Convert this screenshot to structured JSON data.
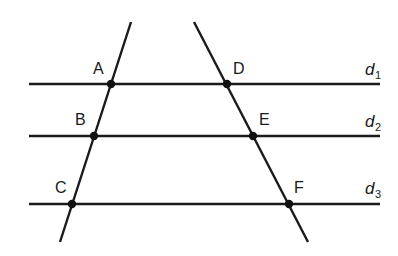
{
  "diagram": {
    "colors": {
      "stroke": "#1a1a1a",
      "point": "#111111",
      "background": "#ffffff"
    },
    "parallels": [
      {
        "id": "d1",
        "letter": "d",
        "subscript": "1",
        "y": 84,
        "x1": 29,
        "x2": 380
      },
      {
        "id": "d2",
        "letter": "d",
        "subscript": "2",
        "y": 136,
        "x1": 29,
        "x2": 380
      },
      {
        "id": "d3",
        "letter": "d",
        "subscript": "3",
        "y": 204,
        "x1": 29,
        "x2": 380
      }
    ],
    "transversals": [
      {
        "id": "left",
        "x1": 131,
        "y1": 22,
        "x2": 60,
        "y2": 242
      },
      {
        "id": "right",
        "x1": 194,
        "y1": 22,
        "x2": 308,
        "y2": 242
      }
    ],
    "points": [
      {
        "label": "A",
        "x": 111,
        "y": 84,
        "lx": 93,
        "ly": 74
      },
      {
        "label": "B",
        "x": 94,
        "y": 136,
        "lx": 75,
        "ly": 125
      },
      {
        "label": "C",
        "x": 72,
        "y": 204,
        "lx": 55,
        "ly": 193
      },
      {
        "label": "D",
        "x": 227,
        "y": 84,
        "lx": 233,
        "ly": 74
      },
      {
        "label": "E",
        "x": 253,
        "y": 136,
        "lx": 259,
        "ly": 125
      },
      {
        "label": "F",
        "x": 289,
        "y": 204,
        "lx": 294,
        "ly": 193
      }
    ],
    "line_labels": [
      {
        "letter": "d",
        "subscript": "1",
        "x": 365,
        "y": 75
      },
      {
        "letter": "d",
        "subscript": "2",
        "x": 365,
        "y": 127
      },
      {
        "letter": "d",
        "subscript": "3",
        "x": 365,
        "y": 194
      }
    ]
  }
}
